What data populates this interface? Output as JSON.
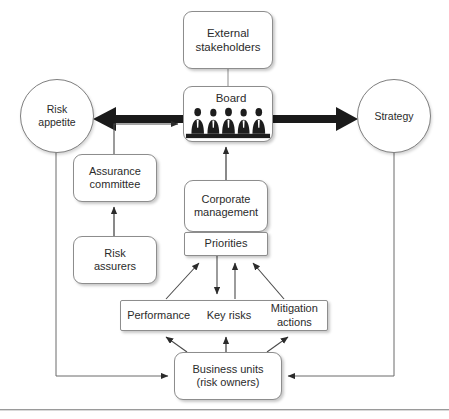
{
  "diagram": {
    "nodes": {
      "external_stakeholders": {
        "label": "External\nstakeholders",
        "shape": "rounded-rect"
      },
      "board": {
        "label": "Board",
        "shape": "rounded-rect",
        "icon": "board-members-icon"
      },
      "risk_appetite": {
        "label": "Risk\nappetite",
        "shape": "circle"
      },
      "strategy": {
        "label": "Strategy",
        "shape": "circle"
      },
      "assurance_committee": {
        "label": "Assurance\ncommittee",
        "shape": "rounded-rect"
      },
      "risk_assurers": {
        "label": "Risk\nassurers",
        "shape": "rounded-rect"
      },
      "corporate_management": {
        "label": "Corporate\nmanagement",
        "shape": "rounded-rect"
      },
      "priorities": {
        "label": "Priorities",
        "shape": "rect"
      },
      "performance": {
        "label": "Performance",
        "shape": "rect-cell"
      },
      "key_risks": {
        "label": "Key risks",
        "shape": "rect-cell"
      },
      "mitigation_actions": {
        "label": "Mitigation\nactions",
        "shape": "rect-cell"
      },
      "business_units": {
        "label": "Business units\n(risk owners)",
        "shape": "rounded-rect"
      }
    },
    "colors": {
      "stroke": "#8d8d8d",
      "text": "#2b2b2b",
      "thick_arrow": "#1a1a1a",
      "background": "#ffffff"
    }
  }
}
